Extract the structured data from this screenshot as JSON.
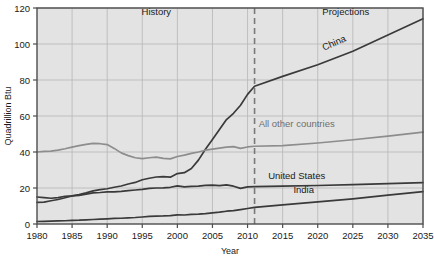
{
  "chart_data": {
    "type": "line",
    "title": "",
    "xlabel": "Year",
    "ylabel": "Quadrillion Btu",
    "xlim": [
      1980,
      2035
    ],
    "ylim": [
      0,
      120
    ],
    "ytick_labels": [
      "0",
      "20",
      "40",
      "60",
      "80",
      "100",
      "120"
    ],
    "yticks": [
      0,
      20,
      40,
      60,
      80,
      100,
      120
    ],
    "xtick_labels": [
      "1980",
      "1985",
      "1990",
      "1995",
      "2000",
      "2005",
      "2010",
      "2015",
      "2020",
      "2025",
      "2030",
      "2035"
    ],
    "xticks": [
      1980,
      1985,
      1990,
      1995,
      2000,
      2005,
      2010,
      2015,
      2020,
      2025,
      2030,
      2035
    ],
    "grid": true,
    "legend": "inline-labels",
    "annotations": [
      {
        "text": "History",
        "x": 1997,
        "y": 116
      },
      {
        "text": "Projections",
        "x": 2024,
        "y": 116
      },
      {
        "text": "China",
        "x": 2022.5,
        "y": 99,
        "rotate": -24
      },
      {
        "text": "All other countries",
        "x": 2017,
        "y": 54
      },
      {
        "text": "United States",
        "x": 2017,
        "y": 25
      },
      {
        "text": "India",
        "x": 2018,
        "y": 17
      }
    ],
    "divider": {
      "label": "history-projection-divider",
      "x": 2011,
      "style": "dashed"
    },
    "series": [
      {
        "name": "China",
        "color": "#3a3a3a",
        "x": [
          1980,
          1981,
          1982,
          1983,
          1984,
          1985,
          1986,
          1987,
          1988,
          1989,
          1990,
          1991,
          1992,
          1993,
          1994,
          1995,
          1996,
          1997,
          1998,
          1999,
          2000,
          2001,
          2002,
          2003,
          2004,
          2005,
          2006,
          2007,
          2008,
          2009,
          2010,
          2011,
          2015,
          2020,
          2025,
          2030,
          2035
        ],
        "values": [
          12.0,
          12.2,
          12.9,
          13.6,
          14.6,
          15.6,
          16.4,
          17.3,
          18.4,
          19.1,
          19.6,
          20.4,
          21.1,
          22.2,
          23.1,
          24.6,
          25.4,
          26.1,
          26.3,
          26.0,
          28.0,
          28.5,
          30.8,
          35.5,
          41.5,
          47.0,
          52.5,
          58.0,
          61.5,
          66.0,
          72.0,
          76.5,
          82.0,
          88.5,
          96.0,
          105.0,
          114.0
        ]
      },
      {
        "name": "All other countries",
        "color": "#8d8d8d",
        "x": [
          1980,
          1981,
          1982,
          1983,
          1984,
          1985,
          1986,
          1987,
          1988,
          1989,
          1990,
          1991,
          1992,
          1993,
          1994,
          1995,
          1996,
          1997,
          1998,
          1999,
          2000,
          2001,
          2002,
          2003,
          2004,
          2005,
          2006,
          2007,
          2008,
          2009,
          2010,
          2011,
          2015,
          2020,
          2025,
          2030,
          2035
        ],
        "values": [
          40.0,
          40.3,
          40.5,
          41.0,
          41.8,
          42.7,
          43.5,
          44.2,
          44.8,
          44.6,
          44.1,
          42.0,
          39.5,
          38.0,
          36.8,
          36.3,
          36.8,
          37.2,
          36.5,
          36.2,
          37.5,
          38.3,
          39.2,
          40.0,
          41.0,
          41.6,
          42.2,
          42.7,
          43.0,
          42.0,
          42.8,
          43.2,
          43.5,
          45.0,
          46.8,
          48.8,
          51.0
        ]
      },
      {
        "name": "United States",
        "color": "#3a3a3a",
        "x": [
          1980,
          1981,
          1982,
          1983,
          1984,
          1985,
          1986,
          1987,
          1988,
          1989,
          1990,
          1991,
          1992,
          1993,
          1994,
          1995,
          1996,
          1997,
          1998,
          1999,
          2000,
          2001,
          2002,
          2003,
          2004,
          2005,
          2006,
          2007,
          2008,
          2009,
          2010,
          2011,
          2015,
          2020,
          2025,
          2030,
          2035
        ],
        "values": [
          15.0,
          14.7,
          14.3,
          14.7,
          15.4,
          15.6,
          15.9,
          16.6,
          17.3,
          17.5,
          17.8,
          17.8,
          18.1,
          18.5,
          18.9,
          19.2,
          19.8,
          20.0,
          20.1,
          20.4,
          21.2,
          20.6,
          20.9,
          21.0,
          21.5,
          21.6,
          21.3,
          21.7,
          21.0,
          19.8,
          20.6,
          20.8,
          21.0,
          21.4,
          21.9,
          22.4,
          23.0
        ]
      },
      {
        "name": "India",
        "color": "#3a3a3a",
        "x": [
          1980,
          1981,
          1982,
          1983,
          1984,
          1985,
          1986,
          1987,
          1988,
          1989,
          1990,
          1991,
          1992,
          1993,
          1994,
          1995,
          1996,
          1997,
          1998,
          1999,
          2000,
          2001,
          2002,
          2003,
          2004,
          2005,
          2006,
          2007,
          2008,
          2009,
          2010,
          2011,
          2015,
          2020,
          2025,
          2030,
          2035
        ],
        "values": [
          1.4,
          1.5,
          1.6,
          1.7,
          1.8,
          2.0,
          2.1,
          2.3,
          2.5,
          2.7,
          2.9,
          3.1,
          3.2,
          3.4,
          3.6,
          3.9,
          4.2,
          4.4,
          4.5,
          4.7,
          5.1,
          5.0,
          5.3,
          5.5,
          5.8,
          6.2,
          6.6,
          7.1,
          7.4,
          8.0,
          8.6,
          9.2,
          10.6,
          12.3,
          14.0,
          16.0,
          18.0
        ]
      }
    ]
  }
}
